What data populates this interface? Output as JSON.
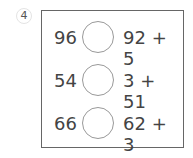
{
  "problem": {
    "number": "4",
    "rows": [
      {
        "left": "96",
        "right": "92 + 5"
      },
      {
        "left": "54",
        "right": "3 + 51"
      },
      {
        "left": "66",
        "right": "62 + 3"
      }
    ]
  }
}
